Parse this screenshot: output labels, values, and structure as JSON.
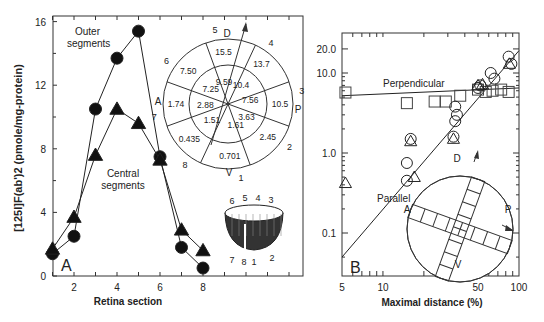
{
  "chart_data": [
    {
      "panel": "A",
      "type": "line",
      "title": "",
      "xlabel": "Retina section",
      "ylabel": "[125I]F(ab')2 (pmole/mg-protein)",
      "xlim": [
        1,
        8.5
      ],
      "ylim": [
        0,
        16
      ],
      "xticks": [
        2,
        4,
        6,
        8
      ],
      "yticks": [
        0,
        4,
        8,
        12,
        16
      ],
      "grid": false,
      "series": [
        {
          "name": "Outer segments",
          "marker": "circle",
          "x": [
            1,
            2,
            3,
            4,
            5,
            6,
            7,
            8
          ],
          "values": [
            1.4,
            2.5,
            10.5,
            13.7,
            15.4,
            7.5,
            1.8,
            0.5
          ]
        },
        {
          "name": "Central segments",
          "marker": "triangle",
          "x": [
            1,
            2,
            3,
            4,
            5,
            6,
            7,
            8
          ],
          "values": [
            1.7,
            3.7,
            7.6,
            10.5,
            9.6,
            7.3,
            2.9,
            1.6
          ]
        }
      ],
      "annotations": [
        "Outer segments",
        "Central segments",
        "A"
      ],
      "inset_polar": {
        "direction_labels": {
          "top": "D",
          "right": "P",
          "bottom": "V",
          "left": "A"
        },
        "sector_numbers": [
          "1",
          "2",
          "3",
          "4",
          "5",
          "6",
          "7",
          "8"
        ],
        "outer_ring": [
          "0.701",
          "2.45",
          "10.5",
          "13.7",
          "15.5",
          "7.50",
          "1.74",
          "0.435"
        ],
        "inner_ring": [
          "1.61",
          "3.63",
          "7.56",
          "10.4",
          "9.59",
          "7.25",
          "2.88",
          "1.51"
        ]
      },
      "inset_cup": {
        "labels_top": [
          "6",
          "5",
          "4",
          "3"
        ],
        "labels_bottom": [
          "7",
          "8",
          "1",
          "2"
        ]
      }
    },
    {
      "panel": "B",
      "type": "scatter",
      "title": "",
      "xlabel": "Maximal distance (%)",
      "ylabel": "",
      "xscale": "log",
      "yscale": "log",
      "xlim": [
        5,
        100
      ],
      "ylim": [
        0.04,
        30
      ],
      "xticks": [
        5,
        10,
        50,
        100
      ],
      "yticks": [
        0.1,
        1.0,
        10.0,
        20.0
      ],
      "ytick_labels": [
        "0.1",
        "1.0",
        "10.0",
        "20.0"
      ],
      "grid": false,
      "lines": [
        {
          "name": "Perpendicular",
          "x": [
            5,
            100
          ],
          "y": [
            5.2,
            6.5
          ]
        },
        {
          "name": "Parallel",
          "x": [
            5,
            100
          ],
          "y": [
            0.05,
            19
          ]
        }
      ],
      "series": [
        {
          "name": "Perpendicular (squares)",
          "marker": "square",
          "x": [
            5.3,
            15,
            24,
            29,
            37,
            50,
            57,
            64,
            74,
            84
          ],
          "values": [
            5.7,
            4.2,
            4.4,
            4.4,
            5.2,
            6.2,
            5.8,
            6.0,
            6.2,
            5.8
          ]
        },
        {
          "name": "Parallel (circles)",
          "marker": "circle",
          "x": [
            15,
            15,
            16,
            33,
            34,
            35,
            34,
            50,
            52,
            62,
            66,
            84,
            88
          ],
          "values": [
            0.75,
            0.45,
            1.5,
            1.6,
            2.5,
            3.0,
            3.8,
            6.5,
            7.0,
            10.0,
            8.5,
            16.0,
            13.0
          ]
        },
        {
          "name": "Parallel (triangles)",
          "marker": "triangle",
          "x": [
            5.3,
            17,
            16,
            33,
            50,
            54,
            85
          ],
          "values": [
            0.42,
            0.5,
            1.4,
            1.5,
            7.0,
            7.2,
            13.0
          ]
        }
      ],
      "annotations": [
        "Perpendicular",
        "Parallel",
        "B"
      ],
      "inset": {
        "direction_labels": {
          "top": "D",
          "right": "P",
          "bottom": "V",
          "left": "A"
        }
      }
    }
  ]
}
